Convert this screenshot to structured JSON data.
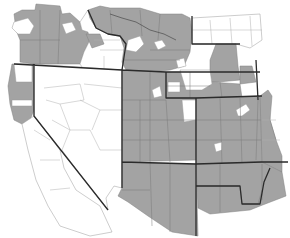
{
  "map": {
    "type": "choropleth",
    "region": "Western United States (county-level)",
    "legend": [],
    "colors": {
      "shaded": "#a3a3a3",
      "unshaded": "#ffffff",
      "state_border": "#2b2b2b",
      "county_border": "#7a7a7a"
    },
    "states": [
      {
        "name": "Oregon",
        "shading": "mostly shaded"
      },
      {
        "name": "Idaho",
        "shading": "mixed"
      },
      {
        "name": "Montana",
        "shading": "mostly shaded"
      },
      {
        "name": "California (northern)",
        "shading": "partially shaded"
      },
      {
        "name": "Nevada",
        "shading": "unshaded"
      },
      {
        "name": "Utah",
        "shading": "shaded"
      },
      {
        "name": "Wyoming",
        "shading": "mostly shaded"
      },
      {
        "name": "Colorado",
        "shading": "shaded"
      },
      {
        "name": "Arizona",
        "shading": "shaded"
      },
      {
        "name": "New Mexico",
        "shading": "shaded"
      }
    ]
  }
}
